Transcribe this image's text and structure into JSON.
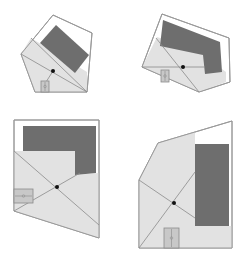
{
  "colors": {
    "background": "#ffffff",
    "outline": "#9a9a9a",
    "visible_area": "#e2e2e2",
    "obstacle": "#6e6e6e",
    "sight_line": "#8a8a8a",
    "viewpoint": "#111111",
    "door_fill": "#c8c8c8",
    "door_stroke": "#8a8a8a"
  },
  "panels": [
    {
      "id": "panel-top-left",
      "outline": "53,15 92,33 87,92 35,92 21,54",
      "visible_area": "21,54 31,38 87,72 87,92 35,92",
      "obstacle": "56,25 89,55 75,73 40,43",
      "sight_lines": [
        [
          21,
          54,
          87,
          92
        ],
        [
          31,
          38,
          87,
          92
        ],
        [
          53,
          71,
          46,
          82
        ]
      ],
      "viewpoint": [
        53,
        71
      ],
      "door": [
        41,
        81,
        8,
        11
      ]
    },
    {
      "id": "panel-top-right",
      "outline": "162,14 229,38 230,82 199,92 142,67",
      "visible_area": "142,67 157,37 195,49 226,72 226,82 199,92",
      "obstacle": "163,20 220,42 222,72 205,74 203,55 160,46",
      "sight_lines": [
        [
          142,
          67,
          205,
          67
        ],
        [
          156,
          38,
          199,
          92
        ]
      ],
      "viewpoint": [
        183,
        67
      ],
      "door": [
        161,
        70,
        8,
        12
      ]
    },
    {
      "id": "panel-top-left-bottom",
      "outline": "14,120 99,120 99,238 14,211",
      "visible_area": "14,151 75,151 75,175 99,173 99,238 14,211",
      "obstacle": "23,126 96,126 96,173 75,175 75,151 23,151",
      "sight_lines": [
        [
          14,
          151,
          99,
          225
        ],
        [
          14,
          211,
          80,
          173
        ]
      ],
      "viewpoint": [
        57,
        187
      ],
      "door": [
        14,
        189,
        19,
        14
      ]
    },
    {
      "id": "panel-bottom-right",
      "outline": "158,143 232,121 232,248 139,248 139,180",
      "visible_area": "139,180 158,143 195,132 195,226 232,226 232,248 139,248",
      "obstacle": "195,144 229,144 229,226 195,226",
      "sight_lines": [
        [
          139,
          180,
          195,
          218
        ],
        [
          139,
          248,
          195,
          172
        ]
      ],
      "viewpoint": [
        174,
        203
      ],
      "door": [
        164,
        228,
        15,
        20
      ]
    }
  ]
}
